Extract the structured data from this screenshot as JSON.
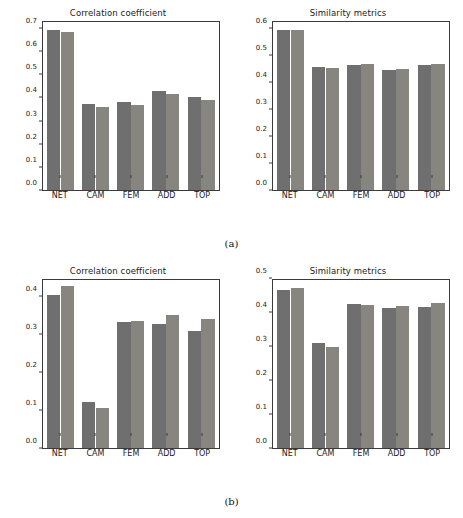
{
  "figure": {
    "captions": [
      {
        "id": "a",
        "text": "(a)"
      },
      {
        "id": "b",
        "text": "(b)"
      }
    ],
    "bar_colors": {
      "series1": "#706f6f",
      "series2": "#86857f"
    },
    "axis_color": "#3b3b3b",
    "background": "#ffffff"
  },
  "chart_data": [
    {
      "id": "a-correlation",
      "type": "bar",
      "title": "Correlation coefficient",
      "xlabel": "",
      "ylabel": "",
      "categories": [
        "NET",
        "CAM",
        "FEM",
        "ADD",
        "TOP"
      ],
      "yticks": [
        0.0,
        0.1,
        0.2,
        0.3,
        0.4,
        0.5,
        0.6,
        0.7
      ],
      "yticklabels": [
        "0.0",
        "0.1",
        "0.2",
        "0.3",
        "0.4",
        "0.5",
        "0.6",
        "0.7"
      ],
      "ylim": [
        0.0,
        0.735
      ],
      "grid": false,
      "legend": "none",
      "series": [
        {
          "name": "series1",
          "color": "#706f6f",
          "values": [
            0.702,
            0.376,
            0.384,
            0.433,
            0.409
          ]
        },
        {
          "name": "series2",
          "color": "#86857f",
          "values": [
            0.69,
            0.364,
            0.373,
            0.421,
            0.396
          ]
        }
      ]
    },
    {
      "id": "a-similarity",
      "type": "bar",
      "title": "Similarity metrics",
      "xlabel": "",
      "ylabel": "",
      "categories": [
        "NET",
        "CAM",
        "FEM",
        "ADD",
        "TOP"
      ],
      "yticks": [
        0.0,
        0.1,
        0.2,
        0.3,
        0.4,
        0.5,
        0.6
      ],
      "yticklabels": [
        "0.0",
        "0.1",
        "0.2",
        "0.3",
        "0.4",
        "0.5",
        "0.6"
      ],
      "ylim": [
        0.0,
        0.63
      ],
      "grid": false,
      "legend": "none",
      "series": [
        {
          "name": "series1",
          "color": "#706f6f",
          "values": [
            0.601,
            0.462,
            0.469,
            0.451,
            0.469
          ]
        },
        {
          "name": "series2",
          "color": "#86857f",
          "values": [
            0.599,
            0.457,
            0.471,
            0.454,
            0.471
          ]
        }
      ]
    },
    {
      "id": "b-correlation",
      "type": "bar",
      "title": "Correlation coefficient",
      "xlabel": "",
      "ylabel": "",
      "categories": [
        "NET",
        "CAM",
        "FEM",
        "ADD",
        "TOP"
      ],
      "yticks": [
        0.0,
        0.1,
        0.2,
        0.3,
        0.4
      ],
      "yticklabels": [
        "0.0",
        "0.1",
        "0.2",
        "0.3",
        "0.4"
      ],
      "ylim": [
        0.0,
        0.448
      ],
      "grid": false,
      "legend": "none",
      "series": [
        {
          "name": "series1",
          "color": "#706f6f",
          "values": [
            0.409,
            0.124,
            0.337,
            0.33,
            0.311
          ]
        },
        {
          "name": "series2",
          "color": "#86857f",
          "values": [
            0.431,
            0.106,
            0.338,
            0.356,
            0.345
          ]
        }
      ]
    },
    {
      "id": "b-similarity",
      "type": "bar",
      "title": "Similarity metrics",
      "xlabel": "",
      "ylabel": "",
      "categories": [
        "NET",
        "CAM",
        "FEM",
        "ADD",
        "TOP"
      ],
      "yticks": [
        0.0,
        0.1,
        0.2,
        0.3,
        0.4,
        0.5
      ],
      "yticklabels": [
        "0.0",
        "0.1",
        "0.2",
        "0.3",
        "0.4",
        "0.5"
      ],
      "ylim": [
        0.0,
        0.5
      ],
      "grid": false,
      "legend": "none",
      "series": [
        {
          "name": "series1",
          "color": "#706f6f",
          "values": [
            0.471,
            0.312,
            0.429,
            0.418,
            0.42
          ]
        },
        {
          "name": "series2",
          "color": "#86857f",
          "values": [
            0.476,
            0.3,
            0.425,
            0.423,
            0.431
          ]
        }
      ]
    }
  ]
}
